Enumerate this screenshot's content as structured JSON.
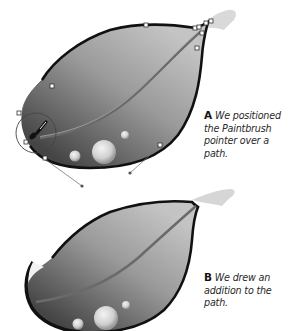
{
  "figure": {
    "panel_a": {
      "letter": "A",
      "caption": "We positioned the Paintbrush pointer over a path.",
      "caption_lines": [
        "We positioned",
        "the Paintbrush",
        "pointer over a path."
      ]
    },
    "panel_b": {
      "letter": "B",
      "caption": "We drew an addition to the path.",
      "caption_lines": [
        "We drew an",
        "addition to the",
        "path."
      ]
    }
  },
  "colors": {
    "leaf_light": "#b8b8b8",
    "leaf_dark": "#4a4a4a",
    "outline": "#111111",
    "stem": "#d6d6d6",
    "anchor_fill": "#ffffff",
    "anchor_stroke": "#333333"
  },
  "icons": {
    "paintbrush_pointer": "paintbrush-icon",
    "anchor_point": "square-anchor"
  }
}
